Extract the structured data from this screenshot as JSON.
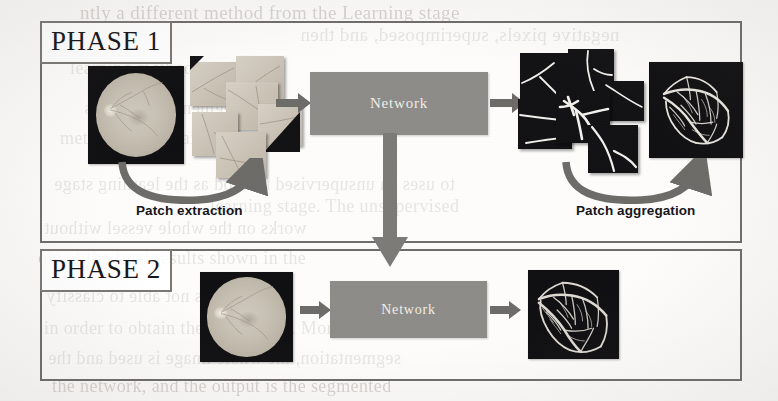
{
  "figure": {
    "background_color": "#fbfaf8",
    "border_color": "#6f6d69",
    "box_color": "#8e8c88",
    "arrow_color": "#6e6c68",
    "text_color": "#17161a"
  },
  "ghost_text": {
    "lines": [
      {
        "text": "ntly a different method from the Learning stage",
        "x": 80,
        "y": 2,
        "size": 19
      },
      {
        "text": "negative pixels, superimposed, and then",
        "x": 300,
        "y": 24,
        "size": 19
      },
      {
        "text": "learning methods",
        "x": 70,
        "y": 58,
        "size": 18
      },
      {
        "text": "segmentation results",
        "x": 84,
        "y": 98,
        "size": 18
      },
      {
        "text": "method as the training",
        "x": 60,
        "y": 128,
        "size": 18
      },
      {
        "text": "to uses an unsupervised method as the learning stage",
        "x": 54,
        "y": 174,
        "size": 18
      },
      {
        "text": "learning stage. The unsupervised",
        "x": 210,
        "y": 196,
        "size": 18
      },
      {
        "text": "works on the whole vessel without",
        "x": 44,
        "y": 218,
        "size": 18
      },
      {
        "text": "ole of the final results shown in the",
        "x": 38,
        "y": 248,
        "size": 18
      },
      {
        "text": "is network is not able to classify",
        "x": 46,
        "y": 286,
        "size": 18
      },
      {
        "text": "in order to obtain the final result. More",
        "x": 44,
        "y": 318,
        "size": 18
      },
      {
        "text": "segmentation, the whole image is used and the",
        "x": 48,
        "y": 348,
        "size": 18
      },
      {
        "text": "the network, and the output is the segmented",
        "x": 52,
        "y": 376,
        "size": 18
      }
    ]
  },
  "phases": [
    {
      "id": "phase1",
      "label": "PHASE 1",
      "network_label": "Network",
      "steps": {
        "input_image": "fundus-input-image",
        "patch_grid": "extracted-patch-mosaic",
        "output_patches": "segmented-patch-mosaic",
        "output_image": "aggregated-vessel-map"
      },
      "captions": [
        {
          "name": "patch-extraction",
          "text": "Patch extraction"
        },
        {
          "name": "patch-aggregation",
          "text": "Patch aggregation"
        }
      ]
    },
    {
      "id": "phase2",
      "label": "PHASE 2",
      "network_label": "Network",
      "steps": {
        "input_image": "fundus-input-image",
        "output_image": "vessel-segmentation-output"
      },
      "captions": []
    }
  ],
  "icons": {
    "right_arrow": "arrow-right-icon",
    "down_arrow": "arrow-down-icon",
    "curve_right": "curved-arrow-right-icon"
  }
}
